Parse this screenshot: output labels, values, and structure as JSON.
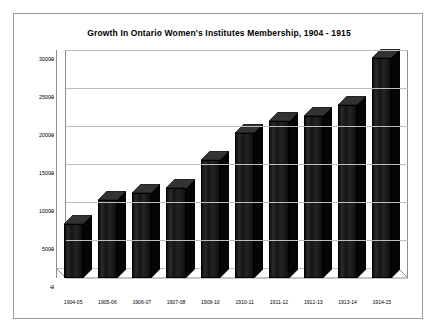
{
  "chart_data": {
    "type": "bar",
    "title": "Growth In Ontario Women's Institutes Membership, 1904 - 1915",
    "xlabel": "",
    "ylabel": "",
    "categories": [
      "1904-05",
      "1905-06",
      "1906-07",
      "1907-08",
      "1909-10",
      "1910-11",
      "1911-12",
      "1912-13",
      "1913-14",
      "1914-15"
    ],
    "values": [
      7100,
      10300,
      11200,
      11800,
      15500,
      19100,
      20700,
      21300,
      22800,
      29000
    ],
    "ylim": [
      0,
      30000
    ],
    "ytick_labels": [
      "0",
      "5000",
      "10000",
      "15000",
      "20000",
      "25000",
      "30000"
    ],
    "ytick_values": [
      0,
      5000,
      10000,
      15000,
      20000,
      25000,
      30000
    ],
    "grid": true,
    "legend": false,
    "style": "3d-column",
    "bar_color": "#1c1c1c",
    "grid_color": "#bdbdbd",
    "frame_color": "#9a9a9a",
    "background": "#ffffff"
  }
}
